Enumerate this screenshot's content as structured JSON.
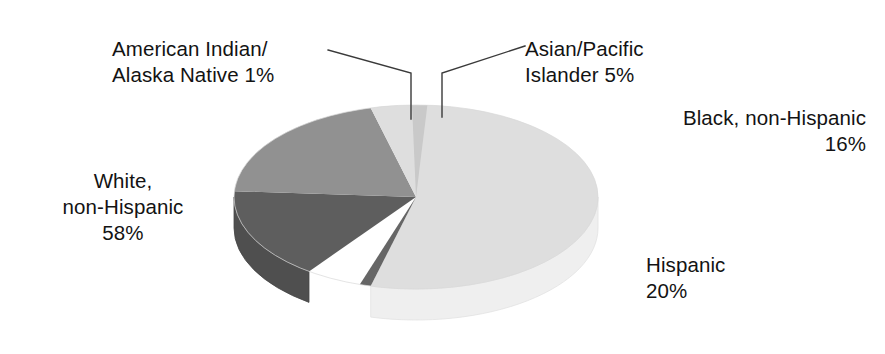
{
  "chart_data": {
    "type": "pie",
    "title": "",
    "subtitle": "",
    "xlabel": "",
    "ylabel": "",
    "legend_position": "callout-labels",
    "grid": false,
    "style": "3d-exploded-none",
    "units": "percent",
    "categories": [
      "White, non-Hispanic",
      "American Indian/Alaska Native",
      "Asian/Pacific Islander",
      "Black, non-Hispanic",
      "Hispanic"
    ],
    "values": [
      58,
      1,
      5,
      16,
      20
    ],
    "slices": [
      {
        "key": "white",
        "name": "White, non-Hispanic",
        "value": 58,
        "value_text": "58%",
        "color": "#dedede",
        "side_color": "#efefef"
      },
      {
        "key": "american-indian",
        "name": "American Indian/Alaska Native",
        "value": 1,
        "value_text": "1%",
        "color": "#666666",
        "side_color": "#555555"
      },
      {
        "key": "asian-pacific-islander",
        "name": "Asian/Pacific Islander",
        "value": 5,
        "value_text": "5%",
        "color": "#c9c9c9",
        "side_color": "#d6d6d6"
      },
      {
        "key": "black",
        "name": "Black, non-Hispanic",
        "value": 16,
        "value_text": "16%",
        "color": "#5e5e5e",
        "side_color": "#4f4f4f"
      },
      {
        "key": "hispanic",
        "name": "Hispanic",
        "value": 20,
        "value_text": "20%",
        "color": "#919191",
        "side_color": "#808080"
      }
    ]
  },
  "labels": {
    "american_indian": "American Indian/\nAlaska Native 1%",
    "asian_pacific": "Asian/Pacific\nIslander 5%",
    "black": "Black, non-Hispanic\n16%",
    "white": "White,\nnon-Hispanic\n58%",
    "hispanic": "Hispanic\n20%"
  },
  "colors": {
    "background": "#ffffff",
    "text": "#131313",
    "leader_line": "#3a3a3a"
  }
}
